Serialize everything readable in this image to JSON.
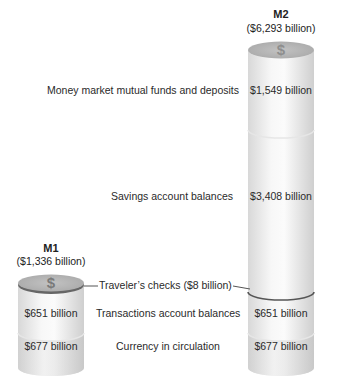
{
  "m2": {
    "title": "M2",
    "total": "($6,293 billion)",
    "icon": "dollar-sign-icon",
    "segments": [
      {
        "name": "Money market mutual funds and deposits",
        "value": "$1,549 billion"
      },
      {
        "name": "Savings account balances",
        "value": "$3,408 billion"
      },
      {
        "name": "Transactions account balances",
        "value": "$651 billion"
      },
      {
        "name": "Currency in circulation",
        "value": "$677 billion"
      }
    ]
  },
  "m1": {
    "title": "M1",
    "total": "($1,336 billion)",
    "icon": "dollar-sign-icon",
    "segments": [
      {
        "name": "Transactions account balances",
        "value": "$651 billion"
      },
      {
        "name": "Currency in circulation",
        "value": "$677 billion"
      }
    ]
  },
  "labels": {
    "money_market": "Money market mutual funds and deposits",
    "savings": "Savings account balances",
    "travelers_checks": "Traveler’s checks ($8 billion)",
    "transactions": "Transactions account balances",
    "currency": "Currency in circulation"
  },
  "dollar_glyph": "$",
  "colors": {
    "cylinder_light": "#f4f4f4",
    "cylinder_shade": "#d4d4d4",
    "cap": "#b8b8b8",
    "cap_rim": "#6e6e6e",
    "divider": "#e2e2e2",
    "travelers_line": "#5a5a5a"
  }
}
